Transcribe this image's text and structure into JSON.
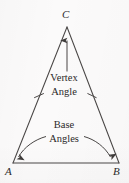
{
  "figure": {
    "kind": "isosceles-triangle-geometry-diagram",
    "background_color": "#fbfafa",
    "stroke_color": "#4a4746",
    "text_color": "#2b2929",
    "vertices": {
      "apex": {
        "label": "C",
        "x": 67,
        "y": 27
      },
      "base_left": {
        "label": "A",
        "x": 13,
        "y": 163
      },
      "base_right": {
        "label": "B",
        "x": 119,
        "y": 163
      }
    },
    "labels": {
      "apex_label": "C",
      "base_left_label": "A",
      "base_right_label": "B"
    },
    "annotations": {
      "vertex_angle": {
        "line1": "Vertex",
        "line2": "Angle"
      },
      "base_angles": {
        "line1": "Base",
        "line2": "Angles"
      }
    },
    "marks": {
      "congruent_leg_ticks": 2,
      "vertex_pointer_arrows": 1,
      "base_pointer_arrows": 2
    }
  }
}
